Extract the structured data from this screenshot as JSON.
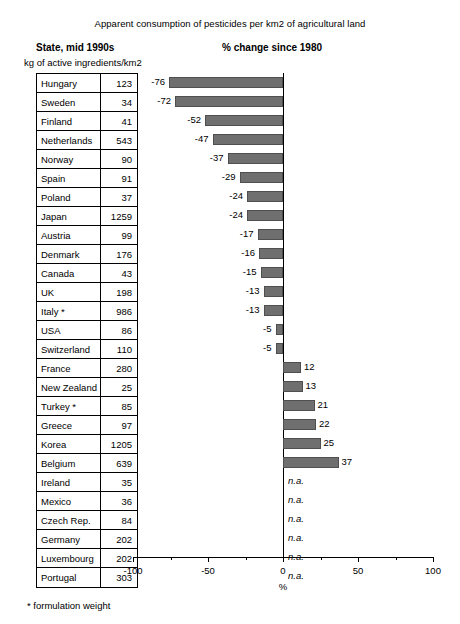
{
  "chart_data": {
    "type": "bar",
    "title": "Apparent consumption of pesticides per km2 of agricultural land",
    "left_header": "State, mid 1990s",
    "left_subheader": "kg of active ingredients/km2",
    "right_header": "% change since 1980",
    "xlabel": "%",
    "ylabel": "",
    "xlim": [
      -100,
      100
    ],
    "xticks": [
      -100,
      -50,
      0,
      50,
      100
    ],
    "xtick_labels": [
      "-100",
      "-50",
      "0",
      "50",
      "100"
    ],
    "grid": false,
    "legend": "none",
    "orientation": "horizontal",
    "bar_color": "#6f6f6f",
    "footnote": "* formulation weight",
    "table_columns": [
      "State",
      "kg of active ingredients/km2"
    ],
    "categories": [
      "Hungary",
      "Sweden",
      "Finland",
      "Netherlands",
      "Norway",
      "Spain",
      "Poland",
      "Japan",
      "Austria",
      "Denmark",
      "Canada",
      "UK",
      "Italy *",
      "USA",
      "Switzerland",
      "France",
      "New Zealand",
      "Turkey *",
      "Greece",
      "Korea",
      "Belgium",
      "Ireland",
      "Mexico",
      "Czech Rep.",
      "Germany",
      "Luxembourg",
      "Portugal"
    ],
    "intensity_values": [
      123,
      34,
      41,
      543,
      90,
      91,
      37,
      1259,
      99,
      176,
      43,
      198,
      986,
      86,
      110,
      280,
      25,
      85,
      97,
      1205,
      639,
      35,
      36,
      84,
      202,
      202,
      303
    ],
    "values": [
      -76,
      -72,
      -52,
      -47,
      -37,
      -29,
      -24,
      -24,
      -17,
      -16,
      -15,
      -13,
      -13,
      -5,
      -5,
      12,
      13,
      21,
      22,
      25,
      37,
      null,
      null,
      null,
      null,
      null,
      null
    ],
    "value_labels": [
      "-76",
      "-72",
      "-52",
      "-47",
      "-37",
      "-29",
      "-24",
      "-24",
      "-17",
      "-16",
      "-15",
      "-13",
      "-13",
      "-5",
      "-5",
      "12",
      "13",
      "21",
      "22",
      "25",
      "37",
      "n.a.",
      "n.a.",
      "n.a.",
      "n.a.",
      "n.a.",
      "n.a."
    ],
    "rows": [
      {
        "state": "Hungary",
        "intensity": "123",
        "change": "-76",
        "change_value": -76
      },
      {
        "state": "Sweden",
        "intensity": "34",
        "change": "-72",
        "change_value": -72
      },
      {
        "state": "Finland",
        "intensity": "41",
        "change": "-52",
        "change_value": -52
      },
      {
        "state": "Netherlands",
        "intensity": "543",
        "change": "-47",
        "change_value": -47
      },
      {
        "state": "Norway",
        "intensity": "90",
        "change": "-37",
        "change_value": -37
      },
      {
        "state": "Spain",
        "intensity": "91",
        "change": "-29",
        "change_value": -29
      },
      {
        "state": "Poland",
        "intensity": "37",
        "change": "-24",
        "change_value": -24
      },
      {
        "state": "Japan",
        "intensity": "1259",
        "change": "-24",
        "change_value": -24
      },
      {
        "state": "Austria",
        "intensity": "99",
        "change": "-17",
        "change_value": -17
      },
      {
        "state": "Denmark",
        "intensity": "176",
        "change": "-16",
        "change_value": -16
      },
      {
        "state": "Canada",
        "intensity": "43",
        "change": "-15",
        "change_value": -15
      },
      {
        "state": "UK",
        "intensity": "198",
        "change": "-13",
        "change_value": -13
      },
      {
        "state": "Italy *",
        "intensity": "986",
        "change": "-13",
        "change_value": -13
      },
      {
        "state": "USA",
        "intensity": "86",
        "change": "-5",
        "change_value": -5
      },
      {
        "state": "Switzerland",
        "intensity": "110",
        "change": "-5",
        "change_value": -5
      },
      {
        "state": "France",
        "intensity": "280",
        "change": "12",
        "change_value": 12
      },
      {
        "state": "New Zealand",
        "intensity": "25",
        "change": "13",
        "change_value": 13
      },
      {
        "state": "Turkey *",
        "intensity": "85",
        "change": "21",
        "change_value": 21
      },
      {
        "state": "Greece",
        "intensity": "97",
        "change": "22",
        "change_value": 22
      },
      {
        "state": "Korea",
        "intensity": "1205",
        "change": "25",
        "change_value": 25
      },
      {
        "state": "Belgium",
        "intensity": "639",
        "change": "37",
        "change_value": 37
      },
      {
        "state": "Ireland",
        "intensity": "35",
        "change": "n.a.",
        "change_value": null
      },
      {
        "state": "Mexico",
        "intensity": "36",
        "change": "n.a.",
        "change_value": null
      },
      {
        "state": "Czech Rep.",
        "intensity": "84",
        "change": "n.a.",
        "change_value": null
      },
      {
        "state": "Germany",
        "intensity": "202",
        "change": "n.a.",
        "change_value": null
      },
      {
        "state": "Luxembourg",
        "intensity": "202",
        "change": "n.a.",
        "change_value": null
      },
      {
        "state": "Portugal",
        "intensity": "303",
        "change": "n.a.",
        "change_value": null
      }
    ]
  }
}
